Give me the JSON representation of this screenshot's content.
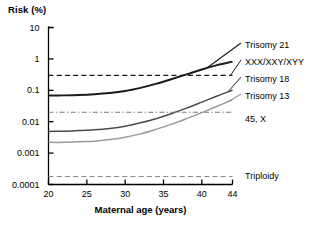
{
  "chart_data": {
    "type": "line",
    "title": "",
    "ylabel": "Risk (%)",
    "xlabel": "Maternal age (years)",
    "xlim": [
      20,
      44
    ],
    "ylim": [
      0.0001,
      10
    ],
    "yscale": "log",
    "grid": false,
    "legend_position": "right-inline-labels",
    "xticks": [
      "20",
      "25",
      "30",
      "35",
      "40",
      "44"
    ],
    "xtick_values": [
      20,
      25,
      30,
      35,
      40,
      44
    ],
    "yticks": [
      "10",
      "1",
      "0.1",
      "0.01",
      "0.001",
      "0.0001"
    ],
    "ytick_values": [
      10,
      1,
      0.1,
      0.01,
      0.001,
      0.0001
    ],
    "x": [
      20,
      22,
      24,
      26,
      28,
      30,
      32,
      34,
      36,
      38,
      40,
      42,
      44
    ],
    "series": [
      {
        "name": "Trisomy 21",
        "label": "Trisomy 21",
        "style": "solid",
        "color": "#1a1a1a",
        "width": 1.9,
        "values": [
          0.068,
          0.069,
          0.071,
          0.075,
          0.082,
          0.095,
          0.12,
          0.16,
          0.225,
          0.32,
          0.46,
          0.63,
          0.82
        ]
      },
      {
        "name": "XXX/XXY/XYY",
        "label": "XXX/XXY/XYY",
        "style": "dashed",
        "color": "#1a1a1a",
        "width": 1.3,
        "values": [
          0.3,
          0.3,
          0.3,
          0.3,
          0.3,
          0.3,
          0.3,
          0.3,
          0.3,
          0.3,
          0.3,
          0.3,
          0.3
        ]
      },
      {
        "name": "Trisomy 18",
        "label": "Trisomy 18",
        "style": "solid",
        "color": "#4a4a4a",
        "width": 1.5,
        "values": [
          0.0049,
          0.005,
          0.0052,
          0.0055,
          0.0061,
          0.0072,
          0.0092,
          0.0125,
          0.018,
          0.027,
          0.042,
          0.066,
          0.1
        ]
      },
      {
        "name": "Trisomy 13",
        "label": "Trisomy 13",
        "style": "solid",
        "color": "#9a9a9a",
        "width": 1.5,
        "values": [
          0.0022,
          0.0022,
          0.0023,
          0.0024,
          0.0027,
          0.0032,
          0.0041,
          0.0057,
          0.0082,
          0.0125,
          0.0195,
          0.031,
          0.05
        ]
      },
      {
        "name": "45, X",
        "label": "45, X",
        "style": "dashdot",
        "color": "#7a7a7a",
        "width": 1.2,
        "values": [
          0.02,
          0.02,
          0.02,
          0.02,
          0.02,
          0.02,
          0.02,
          0.02,
          0.02,
          0.02,
          0.02,
          0.02,
          0.02
        ]
      },
      {
        "name": "Triploidy",
        "label": "Triploidy",
        "style": "dashed",
        "color": "#8a8a8a",
        "width": 1.2,
        "values": [
          0.00018,
          0.00018,
          0.00018,
          0.00018,
          0.00018,
          0.00018,
          0.00018,
          0.00018,
          0.00018,
          0.00018,
          0.00018,
          0.00018,
          0.00018
        ]
      }
    ],
    "annotations": []
  },
  "axes": {
    "y_axis_title": "Risk (%)",
    "x_axis_title": "Maternal age (years)"
  },
  "labels": {
    "trisomy21": "Trisomy 21",
    "xxx_xxy_xyy": "XXX/XXY/XYY",
    "trisomy18": "Trisomy 18",
    "trisomy13": "Trisomy 13",
    "x45": "45, X",
    "triploidy": "Triploidy"
  },
  "colors": {
    "axis": "#000000",
    "background": "#ffffff",
    "trisomy21": "#1a1a1a",
    "trisomy18": "#4a4a4a",
    "trisomy13": "#9a9a9a",
    "x45": "#7a7a7a",
    "triploidy": "#8a8a8a"
  }
}
